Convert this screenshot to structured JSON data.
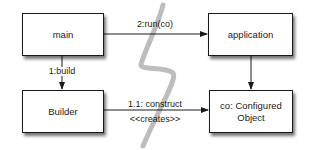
{
  "diagram": {
    "type": "UML communication diagram",
    "nodes": {
      "main": {
        "label": "main"
      },
      "application": {
        "label": "application"
      },
      "builder": {
        "label": "Builder"
      },
      "configured_object": {
        "label": "co: Configured Object",
        "line1": "co: Configured",
        "line2": "Object"
      }
    },
    "edges": {
      "main_to_application": {
        "label": "2:run(co)"
      },
      "main_to_builder": {
        "label": "1:build"
      },
      "builder_to_configured": {
        "label": "1.1: construct",
        "stereotype": "<<creates>>"
      },
      "application_to_configured": {
        "label": ""
      }
    },
    "annotations": {
      "separator_stroke": "lightning-shaped grey line dividing the diagram"
    },
    "colors": {
      "box_border": "#1a1a1a",
      "line": "#1a1a1a",
      "separator": "#b8b8b8",
      "background": "#ffffff"
    }
  }
}
